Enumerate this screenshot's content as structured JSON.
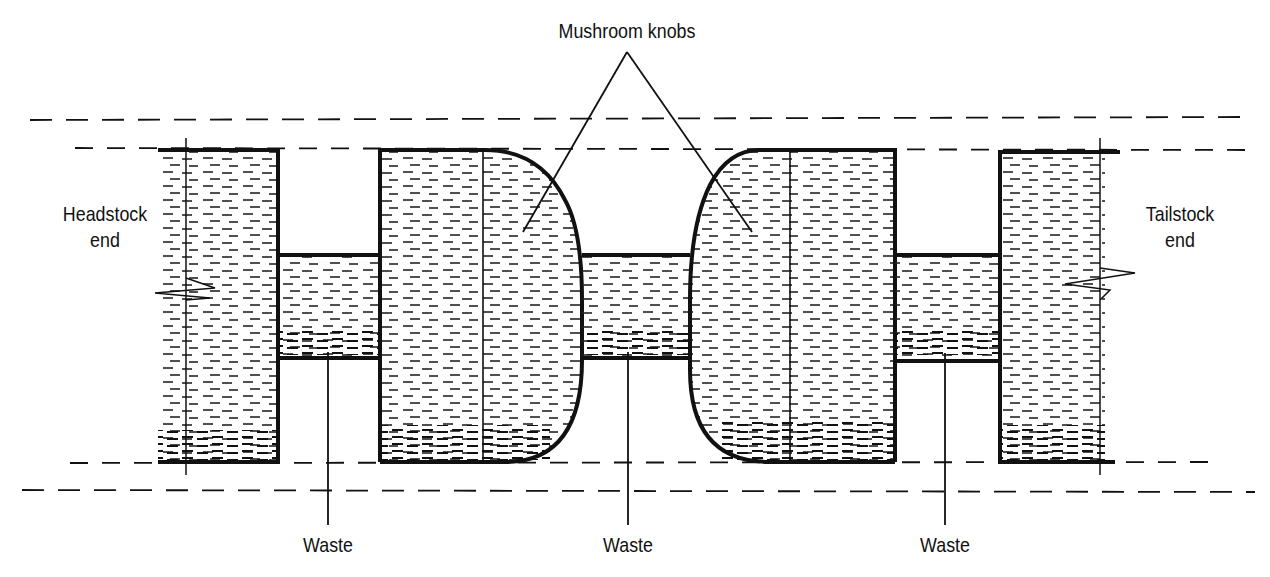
{
  "diagram": {
    "title_label": "Mushroom knobs",
    "left_end": {
      "line1": "Headstock",
      "line2": "end"
    },
    "right_end": {
      "line1": "Tailstock",
      "line2": "end"
    },
    "waste_labels": [
      "Waste",
      "Waste",
      "Waste"
    ],
    "colors": {
      "ink": "#111111",
      "background": "#ffffff"
    }
  }
}
